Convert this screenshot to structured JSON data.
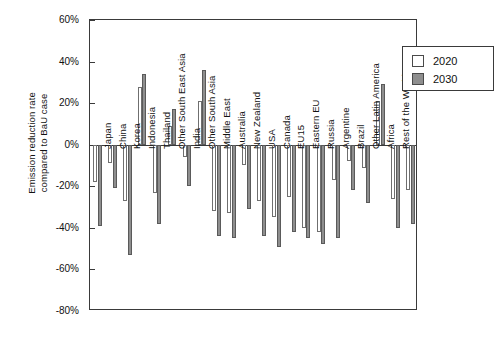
{
  "chart_data": {
    "type": "bar",
    "title": "",
    "xlabel": "",
    "ylabel": "Emission reduction rate\ncompared to BaU case",
    "ylim": [
      -80,
      60
    ],
    "ytick_labels": [
      "60%",
      "40%",
      "20%",
      "0%",
      "-20%",
      "-40%",
      "-60%",
      "-80%"
    ],
    "ytick_values": [
      60,
      40,
      20,
      0,
      -20,
      -40,
      -60,
      -80
    ],
    "grid": false,
    "legend_position": "top-right",
    "categories": [
      "Japan",
      "China",
      "Korea",
      "Indonesia",
      "Thailand",
      "Other South East Asia",
      "India",
      "Other South Asia",
      "Middle East",
      "Australia",
      "New Zealand",
      "USA",
      "Canada",
      "EU15",
      "Eastern EU",
      "Russia",
      "Argentine",
      "Brazil",
      "Other Latin America",
      "Africa",
      "Rest of the World",
      "World"
    ],
    "series": [
      {
        "name": "2020",
        "color": "#ffffff",
        "values": [
          -18,
          -9,
          -27,
          28,
          -23,
          9,
          -6,
          21,
          -32,
          -33,
          -10,
          -27,
          -35,
          -25,
          -40,
          -42,
          -17,
          -8,
          -11,
          21,
          -26,
          -22
        ]
      },
      {
        "name": "2030",
        "color": "#8e8e8e",
        "values": [
          -39,
          -21,
          -53,
          34,
          -38,
          17,
          -20,
          36,
          -44,
          -45,
          -31,
          -44,
          -49,
          -42,
          -45,
          -48,
          -45,
          -22,
          -28,
          29,
          -40,
          -38
        ]
      }
    ]
  },
  "legend": {
    "entries": [
      {
        "label": "2020",
        "swatch": "open-square"
      },
      {
        "label": "2030",
        "swatch": "filled-square"
      }
    ]
  },
  "axis": {
    "y_title_line1": "Emission reduction rate",
    "y_title_line2": "compared to BaU case"
  }
}
